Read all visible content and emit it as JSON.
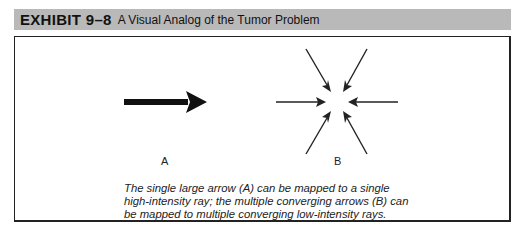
{
  "exhibit": {
    "number": "EXHIBIT 9–8",
    "title": "A Visual Analog of the Tumor Problem"
  },
  "figure": {
    "label_a": "A",
    "label_b": "B",
    "caption": "The single large arrow (A) can be mapped to a single high-intensity ray; the multiple converging arrows (B) can be mapped to multiple converging low-intensity rays.",
    "caption_lines": [
      "The single large arrow (A) can be mapped to a single",
      "high-intensity ray; the multiple converging arrows (B) can",
      "be mapped to multiple converging low-intensity rays."
    ]
  }
}
